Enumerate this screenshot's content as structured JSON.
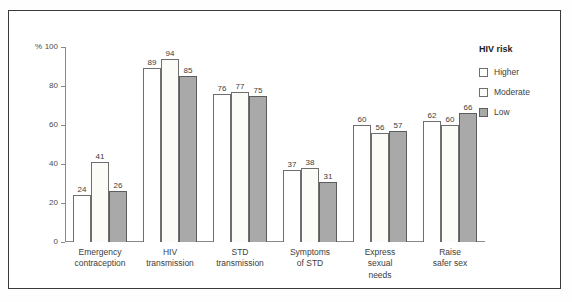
{
  "chart_data": {
    "type": "bar",
    "title": "",
    "xlabel": "",
    "ylabel": "%",
    "ylim": [
      0,
      100
    ],
    "yticks": [
      0,
      20,
      40,
      60,
      80,
      100
    ],
    "ytick_labels": [
      "0",
      "20",
      "40",
      "60",
      "80",
      "100"
    ],
    "y_axis_unit": "%",
    "grid": false,
    "legend_position": "right",
    "legend_title": "HIV risk",
    "categories": [
      "Emergency\ncontraception",
      "HIV\ntransmission",
      "STD\ntransmission",
      "Symptoms\nof STD",
      "Express\nsexual\nneeds",
      "Raise\nsafer sex"
    ],
    "series": [
      {
        "name": "Higher",
        "color": "#ffffff",
        "values": [
          24,
          89,
          76,
          37,
          60,
          62
        ]
      },
      {
        "name": "Moderate",
        "color": "#fbfbf8",
        "values": [
          41,
          94,
          77,
          38,
          56,
          60
        ]
      },
      {
        "name": "Low",
        "color": "#a9a9a9",
        "values": [
          26,
          85,
          75,
          31,
          57,
          66
        ]
      }
    ]
  }
}
